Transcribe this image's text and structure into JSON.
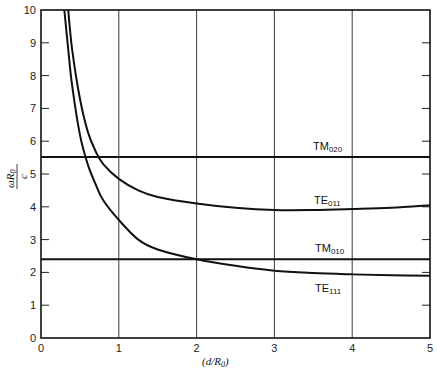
{
  "chart_data": {
    "type": "line",
    "title": "",
    "xlabel": "(d/R0)",
    "ylabel": "ωR0 / c",
    "xlim": [
      0,
      5
    ],
    "ylim": [
      0,
      10
    ],
    "x_ticks": [
      0,
      1,
      2,
      3,
      4,
      5
    ],
    "y_ticks": [
      0,
      1,
      2,
      3,
      4,
      5,
      6,
      7,
      8,
      9,
      10
    ],
    "grid": "vertical lines at x = 1,2,3,4",
    "legend": "none (inline labels)",
    "series": [
      {
        "name": "TM020",
        "label_main": "TM",
        "label_sub": "020",
        "x": [
          0,
          5
        ],
        "y": [
          5.52,
          5.52
        ]
      },
      {
        "name": "TM010",
        "label_main": "TM",
        "label_sub": "010",
        "x": [
          0,
          5
        ],
        "y": [
          2.4,
          2.4
        ]
      },
      {
        "name": "TE011",
        "label_main": "TE",
        "label_sub": "011",
        "x": [
          0.35,
          0.4,
          0.5,
          0.6,
          0.7,
          0.8,
          1.0,
          1.25,
          1.5,
          2.0,
          2.5,
          3.0,
          3.5,
          4.0,
          4.5,
          5.0
        ],
        "y": [
          10.0,
          8.8,
          7.3,
          6.3,
          5.7,
          5.3,
          4.85,
          4.5,
          4.3,
          4.1,
          3.97,
          3.9,
          3.9,
          3.93,
          3.97,
          4.05
        ]
      },
      {
        "name": "TE111",
        "label_main": "TE",
        "label_sub": "111",
        "x": [
          0.3,
          0.35,
          0.4,
          0.5,
          0.6,
          0.7,
          0.8,
          1.0,
          1.25,
          1.5,
          2.0,
          2.5,
          3.0,
          3.5,
          4.0,
          4.5,
          5.0
        ],
        "y": [
          10.0,
          8.8,
          7.7,
          6.2,
          5.3,
          4.7,
          4.2,
          3.6,
          3.0,
          2.7,
          2.4,
          2.2,
          2.05,
          1.98,
          1.94,
          1.91,
          1.9
        ]
      }
    ]
  },
  "axis": {
    "x_tick_labels": [
      "0",
      "1",
      "2",
      "3",
      "4",
      "5"
    ],
    "y_tick_labels": [
      "0",
      "1",
      "2",
      "3",
      "4",
      "5",
      "6",
      "7",
      "8",
      "9",
      "10"
    ],
    "xlabel_open": "(",
    "xlabel_d": "d",
    "xlabel_slash": "/",
    "xlabel_R": "R",
    "xlabel_sub": "0",
    "xlabel_close": ")",
    "ylabel_num_omega": "ω",
    "ylabel_num_R": "R",
    "ylabel_num_sub": "0",
    "ylabel_den": "c"
  },
  "labels": {
    "tm020_main": "TM",
    "tm020_sub": "020",
    "te011_main": "TE",
    "te011_sub": "011",
    "tm010_main": "TM",
    "tm010_sub": "010",
    "te111_main": "TE",
    "te111_sub": "111"
  }
}
